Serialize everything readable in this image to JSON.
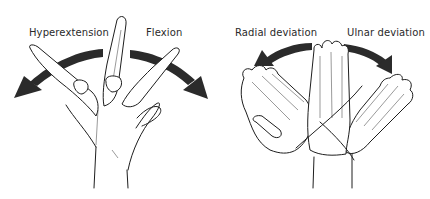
{
  "figures": [
    {
      "id": "flexion-extension",
      "labels": {
        "left": "Hyperextension",
        "right": "Flexion"
      },
      "arrow_directions": {
        "left": "hyperextension",
        "right": "flexion"
      }
    },
    {
      "id": "radial-ulnar",
      "labels": {
        "left": "Radial deviation",
        "right": "Ulnar deviation"
      },
      "arrow_directions": {
        "left": "radial",
        "right": "ulnar"
      }
    }
  ],
  "colors": {
    "ink": "#1e1e1e",
    "arrow": "#2b2b2b",
    "background": "#ffffff"
  }
}
